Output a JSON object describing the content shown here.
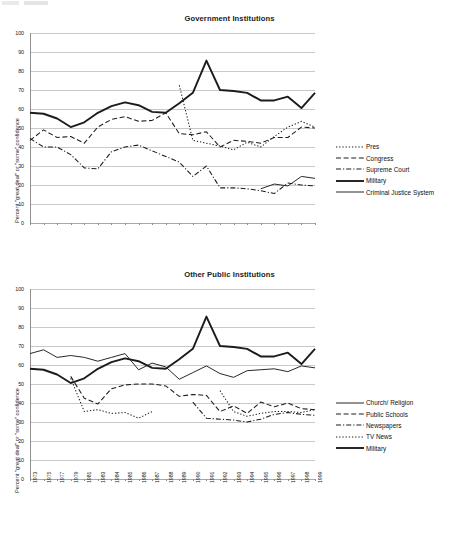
{
  "document": {
    "page_kind": "scanned-figure-page",
    "background_color": "#ffffff",
    "ink_color": "#1a1a1a"
  },
  "charts": [
    {
      "id": "government-institutions",
      "title": "Government Institutions",
      "ylabel": "Percent \"great deal\" or \"some\" confidence",
      "legend_position": "right",
      "legend": [
        {
          "label": "Pres",
          "style": "dotted"
        },
        {
          "label": "Congress",
          "style": "dashed"
        },
        {
          "label": "Supreme Court",
          "style": "dash-dot"
        },
        {
          "label": "Military",
          "style": "thick-solid"
        },
        {
          "label": "Criminal Justice System",
          "style": "thin-solid"
        }
      ]
    },
    {
      "id": "other-public-institutions",
      "title": "Other Public Institutions",
      "ylabel": "Percent \"great deal\" or \"some\" confidence",
      "legend_position": "right",
      "legend": [
        {
          "label": "Church/ Religion",
          "style": "thin-solid"
        },
        {
          "label": "Public Schools",
          "style": "dashed"
        },
        {
          "label": "Newspapers",
          "style": "dash-dot"
        },
        {
          "label": "TV News",
          "style": "dotted"
        },
        {
          "label": "Military",
          "style": "thick-solid"
        }
      ]
    }
  ],
  "chart_data": [
    {
      "type": "line",
      "title": "Government Institutions",
      "xlabel": "",
      "ylabel": "Percent \"great deal\" or \"some\" confidence",
      "ylim": [
        0,
        100
      ],
      "ytick_step": 10,
      "yticks": [
        0,
        10,
        20,
        30,
        40,
        50,
        60,
        70,
        80,
        90,
        100
      ],
      "grid": true,
      "legend": "right",
      "categories": [
        "1973",
        "1975",
        "1977",
        "1979",
        "1981",
        "1983",
        "1984",
        "1985",
        "1986",
        "1987",
        "1988",
        "1989",
        "1990",
        "1991",
        "1992",
        "1993",
        "1994",
        "1995",
        "1996",
        "1997",
        "1998",
        "1999"
      ],
      "series": [
        {
          "name": "Pres",
          "style": "dotted",
          "values": [
            null,
            null,
            null,
            null,
            null,
            null,
            null,
            null,
            null,
            null,
            null,
            72.5,
            43.5,
            42.0,
            40.5,
            38.5,
            42.5,
            40.0,
            45.5,
            50.5,
            53.5,
            50.5
          ]
        },
        {
          "name": "Congress",
          "style": "dashed",
          "values": [
            43.5,
            49.0,
            45.0,
            45.5,
            42.0,
            50.5,
            54.5,
            56.0,
            53.5,
            54.0,
            58.0,
            47.0,
            46.5,
            48.0,
            40.0,
            43.5,
            43.0,
            42.0,
            45.0,
            45.0,
            50.5,
            50.0
          ]
        },
        {
          "name": "Supreme Court",
          "style": "dash-dot",
          "values": [
            44.5,
            40.0,
            40.0,
            36.0,
            29.0,
            28.5,
            37.5,
            40.0,
            41.0,
            38.0,
            35.0,
            32.0,
            24.5,
            30.0,
            18.5,
            18.5,
            18.0,
            17.0,
            15.5,
            21.0,
            20.0,
            19.5
          ]
        },
        {
          "name": "Military",
          "style": "thick-solid",
          "values": [
            58.0,
            57.5,
            55.0,
            50.5,
            53.0,
            58.0,
            61.5,
            63.5,
            62.0,
            58.5,
            58.0,
            63.0,
            68.5,
            85.5,
            70.0,
            69.5,
            68.5,
            64.5,
            64.5,
            66.5,
            60.5,
            68.5
          ]
        },
        {
          "name": "Criminal Justice System",
          "style": "thin-solid",
          "values": [
            null,
            null,
            null,
            null,
            null,
            null,
            null,
            null,
            null,
            null,
            null,
            null,
            null,
            null,
            null,
            null,
            null,
            18.0,
            20.5,
            19.5,
            24.5,
            23.5
          ]
        }
      ]
    },
    {
      "type": "line",
      "title": "Other Public Institutions",
      "xlabel": "",
      "ylabel": "Percent \"great deal\" or \"some\" confidence",
      "ylim": [
        0,
        100
      ],
      "ytick_step": 10,
      "yticks": [
        0,
        10,
        20,
        30,
        40,
        50,
        60,
        70,
        80,
        90,
        100
      ],
      "grid": true,
      "legend": "right",
      "categories": [
        "1973",
        "1975",
        "1977",
        "1979",
        "1981",
        "1983",
        "1984",
        "1985",
        "1986",
        "1987",
        "1988",
        "1989",
        "1990",
        "1991",
        "1992",
        "1993",
        "1994",
        "1995",
        "1996",
        "1997",
        "1998",
        "1999"
      ],
      "series": [
        {
          "name": "Church/ Religion",
          "style": "thin-solid",
          "values": [
            66.0,
            68.0,
            64.0,
            65.0,
            64.0,
            62.0,
            64.0,
            66.0,
            57.5,
            61.0,
            59.0,
            52.5,
            56.0,
            59.5,
            55.5,
            53.5,
            57.0,
            57.5,
            58.0,
            56.5,
            59.5,
            58.5
          ]
        },
        {
          "name": "Public Schools",
          "style": "dashed",
          "values": [
            null,
            null,
            null,
            54.0,
            42.5,
            39.5,
            47.5,
            49.5,
            50.0,
            50.0,
            49.0,
            43.5,
            44.5,
            44.0,
            35.5,
            38.5,
            34.5,
            40.5,
            38.0,
            40.0,
            37.0,
            36.5
          ]
        },
        {
          "name": "Newspapers",
          "style": "dash-dot",
          "values": [
            null,
            null,
            null,
            null,
            null,
            null,
            null,
            null,
            null,
            null,
            null,
            null,
            40.5,
            32.0,
            31.5,
            31.0,
            30.0,
            31.5,
            34.0,
            35.0,
            34.0,
            33.5
          ]
        },
        {
          "name": "TV News",
          "style": "dotted",
          "values": [
            null,
            null,
            null,
            53.0,
            35.5,
            36.5,
            34.5,
            35.0,
            32.0,
            35.5,
            null,
            null,
            null,
            null,
            46.5,
            35.5,
            33.0,
            34.5,
            35.5,
            35.5,
            35.0,
            36.5
          ]
        },
        {
          "name": "Military",
          "style": "thick-solid",
          "values": [
            58.0,
            57.5,
            55.0,
            50.5,
            53.0,
            58.0,
            61.5,
            63.5,
            62.0,
            58.5,
            58.0,
            63.0,
            68.5,
            85.5,
            70.0,
            69.5,
            68.5,
            64.5,
            64.5,
            66.5,
            60.5,
            68.5
          ]
        }
      ]
    }
  ]
}
